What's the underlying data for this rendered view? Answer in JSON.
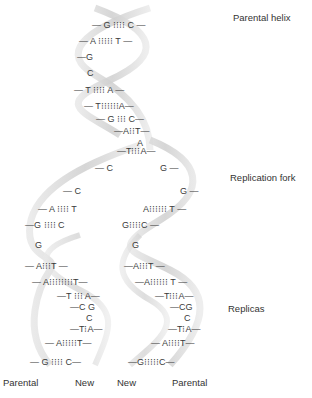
{
  "labels": {
    "parental_helix": "Parental helix",
    "replication_fork": "Replication fork",
    "replicas": "Replicas",
    "bottom": [
      "Parental",
      "New",
      "New",
      "Parental"
    ]
  },
  "colors": {
    "ribbon": "#d9d9d9",
    "ribbon_dark": "#c4c4c4",
    "text": "#333333"
  },
  "parental_pairs": [
    {
      "x": 92,
      "y": 20,
      "text": "— G ⁝⁝⁝⁝ C —"
    },
    {
      "x": 79,
      "y": 36,
      "text": "— A ⁝⁝⁝⁝⁝ T —"
    },
    {
      "x": 77,
      "y": 52,
      "text": "—G"
    },
    {
      "x": 87,
      "y": 68,
      "text": "C"
    },
    {
      "x": 74,
      "y": 85,
      "text": "— T ⁝⁝⁝⁝ A —"
    },
    {
      "x": 84,
      "y": 101,
      "text": "— T⁝⁝⁝⁝⁝⁝A—"
    },
    {
      "x": 96,
      "y": 114,
      "text": "— G ⁝⁝⁝ C—"
    },
    {
      "x": 114,
      "y": 126,
      "text": "—A⁝⁝T—"
    },
    {
      "x": 137,
      "y": 138,
      "text": "A"
    },
    {
      "x": 117,
      "y": 146,
      "text": "—T⁝⁝⁝A—"
    }
  ],
  "left_replica": [
    {
      "x": 95,
      "y": 163,
      "text": "— C"
    },
    {
      "x": 63,
      "y": 186,
      "text": "— C"
    },
    {
      "x": 38,
      "y": 204,
      "text": "— A ⁝⁝⁝⁝ T"
    },
    {
      "x": 25,
      "y": 220,
      "text": "—G ⁝⁝⁝⁝ C"
    },
    {
      "x": 35,
      "y": 240,
      "text": "G"
    },
    {
      "x": 25,
      "y": 261,
      "text": "— A⁝⁝⁝T —"
    },
    {
      "x": 32,
      "y": 277,
      "text": "— A⁝⁝⁝⁝⁝⁝⁝⁝T—"
    },
    {
      "x": 57,
      "y": 291,
      "text": "—T ⁝⁝⁝ A—"
    },
    {
      "x": 70,
      "y": 302,
      "text": "—C G"
    },
    {
      "x": 86,
      "y": 313,
      "text": "C"
    },
    {
      "x": 70,
      "y": 324,
      "text": "—T⁝A—"
    },
    {
      "x": 45,
      "y": 338,
      "text": "— A⁝⁝⁝⁝⁝T—"
    },
    {
      "x": 30,
      "y": 357,
      "text": "— G ⁝⁝⁝⁝ C—"
    }
  ],
  "right_replica": [
    {
      "x": 160,
      "y": 163,
      "text": "G —"
    },
    {
      "x": 180,
      "y": 186,
      "text": "G —"
    },
    {
      "x": 143,
      "y": 204,
      "text": "A⁝⁝⁝⁝⁝⁝ T —"
    },
    {
      "x": 122,
      "y": 220,
      "text": "G⁝⁝⁝⁝C —"
    },
    {
      "x": 132,
      "y": 240,
      "text": "G"
    },
    {
      "x": 124,
      "y": 261,
      "text": "—A⁝⁝⁝T —"
    },
    {
      "x": 135,
      "y": 277,
      "text": "—A⁝⁝⁝⁝⁝⁝ T —"
    },
    {
      "x": 155,
      "y": 291,
      "text": "—T⁝⁝⁝A—"
    },
    {
      "x": 170,
      "y": 302,
      "text": "—CG"
    },
    {
      "x": 184,
      "y": 313,
      "text": "C"
    },
    {
      "x": 168,
      "y": 324,
      "text": "—T⁝A—"
    },
    {
      "x": 151,
      "y": 338,
      "text": "— A⁝⁝⁝⁝T—"
    },
    {
      "x": 128,
      "y": 357,
      "text": "—G⁝⁝⁝⁝⁝C—"
    }
  ]
}
